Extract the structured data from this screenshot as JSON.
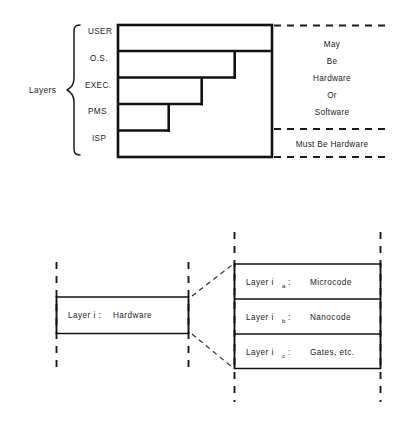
{
  "figure": {
    "background_color": "#ffffff",
    "line_color": "#111111",
    "text_color": "#1a1a1a"
  },
  "top_diagram": {
    "group_label": "Layers",
    "layer_labels": [
      "USER",
      "O.S.",
      "EXEC.",
      "PMS",
      "ISP"
    ],
    "right_annotation_upper": [
      "May",
      "Be",
      "Hardware",
      "Or",
      "Software"
    ],
    "right_annotation_lower": "Must  Be   Hardware"
  },
  "bottom_diagram": {
    "left_box": {
      "label": "Layer i :",
      "value": "Hardware"
    },
    "right_boxes": [
      {
        "label": "Layer i",
        "subscript": "a",
        "colon": ":",
        "value": "Microcode"
      },
      {
        "label": "Layer i",
        "subscript": "b",
        "colon": ":",
        "value": "Nanocode"
      },
      {
        "label": "Layer i",
        "subscript": "c",
        "colon": ":",
        "value": "Gates, etc."
      }
    ]
  }
}
